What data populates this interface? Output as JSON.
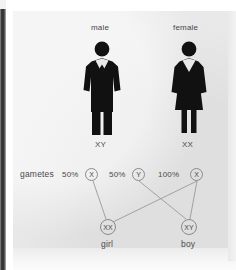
{
  "diagram": {
    "title_parents": [
      "male",
      "female"
    ],
    "parents": [
      {
        "label": "male",
        "karyotype": "XY",
        "figure": "male-figure-icon"
      },
      {
        "label": "female",
        "karyotype": "XX",
        "figure": "female-figure-icon"
      }
    ],
    "gametes_label": "gametes",
    "gametes": [
      {
        "percent": "50%",
        "allele": "X",
        "from": "male"
      },
      {
        "percent": "50%",
        "allele": "Y",
        "from": "male"
      },
      {
        "percent": "100%",
        "allele": "X",
        "from": "female"
      }
    ],
    "offspring": [
      {
        "genotype": "XX",
        "label": "girl"
      },
      {
        "genotype": "XY",
        "label": "boy"
      }
    ],
    "colors": {
      "figure": "#111111",
      "text": "#4a4a4a",
      "line": "#9a9a9a",
      "panel": "#e9e9e9",
      "edge_strip": "#2e2e2e"
    }
  }
}
